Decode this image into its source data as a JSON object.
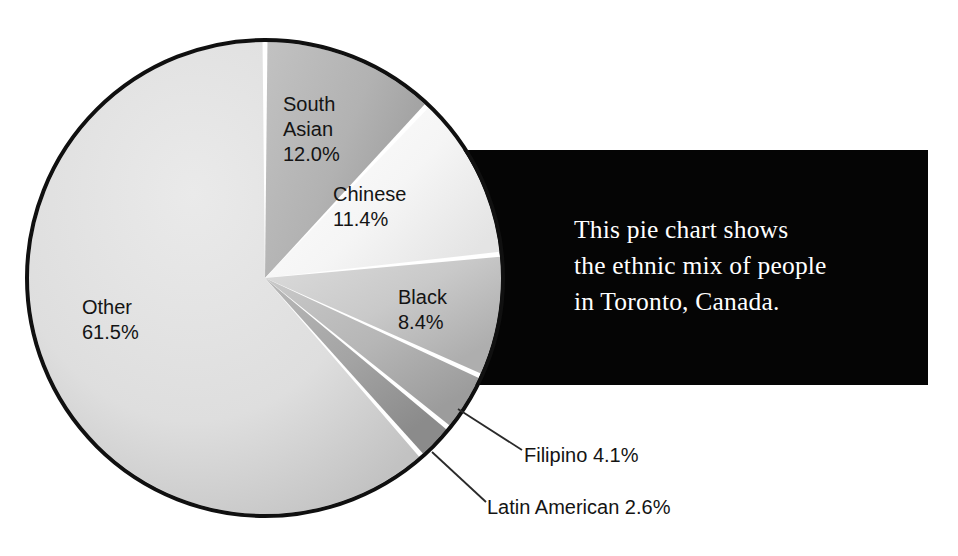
{
  "chart_data": {
    "type": "pie",
    "title": "",
    "caption": "This pie chart shows the ethnic mix of people in Toronto, Canada.",
    "caption_lines": [
      "This pie chart shows",
      "the ethnic mix of people",
      "in Toronto, Canada."
    ],
    "unit": "%",
    "total": 100.0,
    "start_angle_deg": 0,
    "direction": "clockwise",
    "categories": [
      "South Asian",
      "Chinese",
      "Black",
      "Filipino",
      "Latin American",
      "Other"
    ],
    "values": [
      12.0,
      11.4,
      8.4,
      4.1,
      2.6,
      61.5
    ],
    "slices": [
      {
        "name": "South Asian",
        "value": 12.0,
        "value_label": "12.0%",
        "label_lines": [
          "South",
          "Asian",
          "12.0%"
        ],
        "color": "#b4b4b4",
        "color_edge": "#9a9a9a",
        "label_placement": "inside"
      },
      {
        "name": "Chinese",
        "value": 11.4,
        "value_label": "11.4%",
        "label_lines": [
          "Chinese",
          "11.4%"
        ],
        "color": "#f4f4f4",
        "color_edge": "#e2e2e2",
        "label_placement": "inside"
      },
      {
        "name": "Black",
        "value": 8.4,
        "value_label": "8.4%",
        "label_lines": [
          "Black",
          "8.4%"
        ],
        "color": "#cccccc",
        "color_edge": "#b2b2b2",
        "label_placement": "inside"
      },
      {
        "name": "Filipino",
        "value": 4.1,
        "value_label": "4.1%",
        "callout_text": "Filipino 4.1%",
        "color": "#b8b8b8",
        "color_edge": "#9d9d9d",
        "label_placement": "callout"
      },
      {
        "name": "Latin American",
        "value": 2.6,
        "value_label": "2.6%",
        "callout_text": "Latin American 2.6%",
        "color": "#a6a6a6",
        "color_edge": "#8c8c8c",
        "label_placement": "callout"
      },
      {
        "name": "Other",
        "value": 61.5,
        "value_label": "61.5%",
        "label_lines": [
          "Other",
          "61.5%"
        ],
        "color": "#dedede",
        "color_edge": "#c6c6c6",
        "label_placement": "inside"
      }
    ],
    "legend": "none",
    "grid": false,
    "separator_color": "#ffffff",
    "outline_color": "#101010",
    "panel_color": "#050505",
    "panel_text_color": "#ffffff",
    "label_text_color": "#141414"
  }
}
